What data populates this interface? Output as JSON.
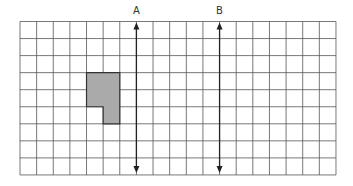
{
  "diagram": {
    "type": "grid-with-reflection-lines",
    "grid": {
      "columns": 19,
      "rows": 9,
      "origin_x": 20,
      "origin_y": 21.5,
      "cell_w": 16.63,
      "cell_h": 17.05,
      "line_color": "#555555"
    },
    "shape": {
      "fill": "#aaaaaa",
      "stroke": "#333333",
      "cells": [
        [
          4,
          3
        ],
        [
          5,
          3
        ],
        [
          4,
          4
        ],
        [
          5,
          4
        ],
        [
          5,
          5
        ]
      ],
      "outline_grid_points": [
        [
          4,
          3
        ],
        [
          6,
          3
        ],
        [
          6,
          6
        ],
        [
          5,
          6
        ],
        [
          5,
          5
        ],
        [
          4,
          5
        ]
      ]
    },
    "lines": [
      {
        "label": "A",
        "grid_x": 7,
        "color": "#222222"
      },
      {
        "label": "B",
        "grid_x": 12,
        "color": "#222222"
      }
    ]
  }
}
